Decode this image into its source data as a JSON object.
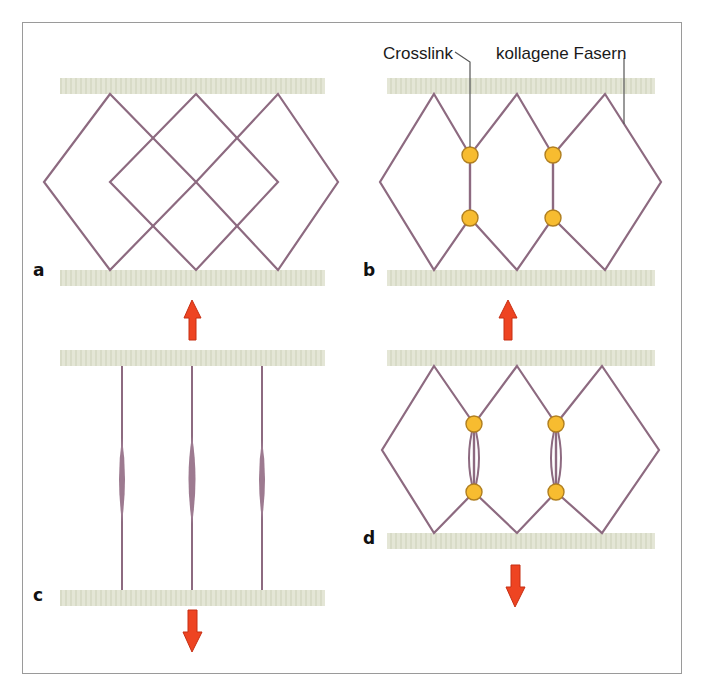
{
  "figure": {
    "background": "#ffffff",
    "border_color": "#9a9a9a"
  },
  "colors": {
    "fiber": "#8d6a80",
    "band": "#e4e6d6",
    "band_stripe": "#d6d9c3",
    "crosslink_fill": "#f7bc30",
    "crosslink_stroke": "#b07f20",
    "arrow": "#ee4422",
    "arrow_edge": "#c62e12",
    "leader": "#555555",
    "text": "#1a1a1a"
  },
  "callouts": [
    {
      "id": "crosslink",
      "label": "Crosslink",
      "x": 383,
      "y": 44
    },
    {
      "id": "kollagene-fasern",
      "label": "kollagene Fasern",
      "x": 496,
      "y": 44
    }
  ],
  "panels": [
    {
      "id": "a",
      "label": "a",
      "label_x": 33,
      "label_y": 260,
      "caption": "unstretched network without crosslinks",
      "has_crosslinks": false,
      "state": "relaxed",
      "arrow": {
        "direction": "up",
        "x": 192,
        "y": 300
      }
    },
    {
      "id": "b",
      "label": "b",
      "label_x": 363,
      "label_y": 260,
      "caption": "unstretched network with crosslinks",
      "has_crosslinks": true,
      "state": "relaxed",
      "crosslink_count": 4,
      "arrow": {
        "direction": "up",
        "x": 508,
        "y": 300
      }
    },
    {
      "id": "c",
      "label": "c",
      "label_x": 33,
      "label_y": 585,
      "caption": "fully stretched fibres without crosslinks",
      "has_crosslinks": false,
      "state": "stretched",
      "fiber_count": 3,
      "arrow": {
        "direction": "down",
        "x": 192,
        "y": 608
      }
    },
    {
      "id": "d",
      "label": "d",
      "label_x": 363,
      "label_y": 540,
      "caption": "stretched network limited by crosslinks",
      "has_crosslinks": true,
      "state": "stretched",
      "crosslink_count": 4,
      "arrow": {
        "direction": "down",
        "x": 508,
        "y": 565
      }
    }
  ],
  "legend": {
    "crosslink_marker": "yellow-circle",
    "fiber_marker": "mauve-line",
    "band_marker": "pale-hatched-bar"
  }
}
